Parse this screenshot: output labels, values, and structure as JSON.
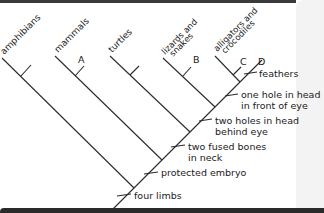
{
  "diagram": {
    "type": "cladogram",
    "taxa": [
      {
        "name": "amphibians",
        "marker": ""
      },
      {
        "name": "mammals",
        "marker": "A"
      },
      {
        "name": "turtles",
        "marker": ""
      },
      {
        "name": "lizards and",
        "name2": "snakes",
        "marker": "B"
      },
      {
        "name": "alligators and",
        "name2": "crocodiles",
        "marker": "C"
      },
      {
        "name": "",
        "marker": "D"
      }
    ],
    "traits": [
      {
        "line1": "feathers",
        "line2": ""
      },
      {
        "line1": "one hole in head",
        "line2": "in front of eye"
      },
      {
        "line1": "two holes in head",
        "line2": "behind eye"
      },
      {
        "line1": "two fused bones",
        "line2": "in neck"
      },
      {
        "line1": "protected embryo",
        "line2": ""
      },
      {
        "line1": "four limbs",
        "line2": ""
      }
    ]
  }
}
